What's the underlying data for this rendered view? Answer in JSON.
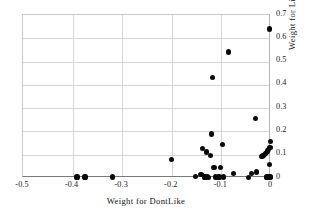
{
  "chart_data": {
    "type": "scatter",
    "title": "",
    "xlabel": "Weight for DontLike",
    "ylabel": "Weight for Like",
    "xlim": [
      -0.5,
      0.0
    ],
    "ylim": [
      0.0,
      0.7
    ],
    "xticks": [
      "-0.5",
      "-0.4",
      "-0.3",
      "-0.2",
      "-0.1",
      "0"
    ],
    "xtick_values": [
      -0.5,
      -0.4,
      -0.3,
      -0.2,
      -0.1,
      0.0
    ],
    "yticks": [
      "0",
      "0.1",
      "0.2",
      "0.3",
      "0.4",
      "0.5",
      "0.6",
      "0.7"
    ],
    "ytick_values": [
      0.0,
      0.1,
      0.2,
      0.3,
      0.4,
      0.5,
      0.6,
      0.7
    ],
    "grid": "horizontal-and-vertical",
    "legend": "none",
    "marker": "filled-circle",
    "marker_color": "#0a0a0a",
    "series": [
      {
        "name": "weights",
        "points": [
          [
            -0.391,
            0.004
          ],
          [
            -0.375,
            0.004
          ],
          [
            -0.32,
            0.004
          ],
          [
            -0.2,
            0.079
          ],
          [
            -0.152,
            0.006
          ],
          [
            -0.141,
            0.016
          ],
          [
            -0.138,
            0.126
          ],
          [
            -0.133,
            0.004
          ],
          [
            -0.13,
            0.112
          ],
          [
            -0.128,
            0.006
          ],
          [
            -0.126,
            0.002
          ],
          [
            -0.122,
            0.095
          ],
          [
            -0.12,
            0.189
          ],
          [
            -0.118,
            0.43
          ],
          [
            -0.115,
            0.045
          ],
          [
            -0.112,
            0.004
          ],
          [
            -0.108,
            0.003
          ],
          [
            -0.105,
            0.004
          ],
          [
            -0.102,
            0.044
          ],
          [
            -0.098,
            0.144
          ],
          [
            -0.095,
            0.004
          ],
          [
            -0.086,
            0.541
          ],
          [
            -0.076,
            0.021
          ],
          [
            -0.046,
            0.003
          ],
          [
            -0.04,
            0.018
          ],
          [
            -0.032,
            0.256
          ],
          [
            -0.03,
            0.026
          ],
          [
            -0.018,
            0.092
          ],
          [
            -0.016,
            0.095
          ],
          [
            -0.013,
            0.1
          ],
          [
            -0.011,
            0.104
          ],
          [
            -0.009,
            0.11
          ],
          [
            -0.008,
            0.004
          ],
          [
            -0.007,
            0.116
          ],
          [
            -0.006,
            0.008
          ],
          [
            -0.005,
            0.124
          ],
          [
            -0.004,
            0.003
          ],
          [
            -0.003,
            0.057
          ],
          [
            -0.002,
            0.132
          ],
          [
            -0.002,
            0.006
          ],
          [
            -0.001,
            0.157
          ],
          [
            -0.001,
            0.002
          ],
          [
            -0.003,
            0.64
          ]
        ]
      }
    ]
  }
}
